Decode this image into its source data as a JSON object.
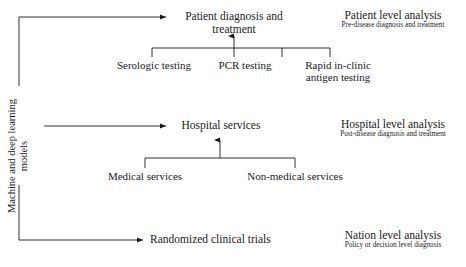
{
  "figure": {
    "background_color": "#ffffff",
    "line_color": "#1a1a1a",
    "text_color": "#1a1a1a"
  },
  "spine": {
    "label": "Machine and deep learning\nmodels"
  },
  "rows": [
    {
      "id": "patient",
      "node": "Patient diagnosis and\ntreatment",
      "children": [
        "Serologic testing",
        "PCR testing",
        "Rapid in-clinic\nantigen testing"
      ],
      "analysis_title": "Patient level analysis",
      "analysis_subtitle": "Pre-disease diagnosis and treatment"
    },
    {
      "id": "hospital",
      "node": "Hospital services",
      "children": [
        "Medical services",
        "Non-medical services"
      ],
      "analysis_title": "Hospital level analysis",
      "analysis_subtitle": "Post-disease diagnosis and treatment"
    },
    {
      "id": "nation",
      "node": "Randomized clinical trials",
      "children": [],
      "analysis_title": "Nation level analysis",
      "analysis_subtitle": "Policy or decision level diagnosis"
    }
  ]
}
